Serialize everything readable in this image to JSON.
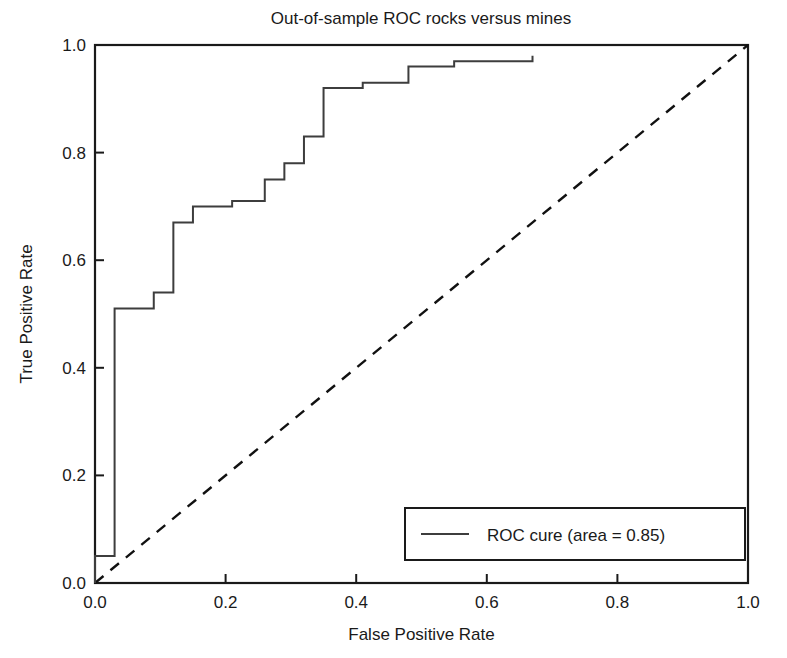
{
  "chart_data": {
    "type": "line",
    "title": "Out-of-sample ROC rocks versus mines",
    "xlabel": "False Positive Rate",
    "ylabel": "True Positive Rate",
    "xlim": [
      0.0,
      1.0
    ],
    "ylim": [
      0.0,
      1.0
    ],
    "grid": false,
    "legend_position": "lower right",
    "xticks": [
      "0.0",
      "0.2",
      "0.4",
      "0.6",
      "0.8",
      "1.0"
    ],
    "xtick_values": [
      0.0,
      0.2,
      0.4,
      0.6,
      0.8,
      1.0
    ],
    "yticks": [
      "0.0",
      "0.2",
      "0.4",
      "0.6",
      "0.8",
      "1.0"
    ],
    "ytick_values": [
      0.0,
      0.2,
      0.4,
      0.6,
      0.8,
      1.0
    ],
    "series": [
      {
        "name": "ROC cure (area = 0.85)",
        "drawstyle": "steps-post",
        "linestyle": "solid",
        "color": "#3d3d3d",
        "area_under_curve": 0.85,
        "x": [
          0.0,
          0.0,
          0.03,
          0.03,
          0.09,
          0.09,
          0.12,
          0.12,
          0.15,
          0.15,
          0.21,
          0.21,
          0.26,
          0.26,
          0.29,
          0.29,
          0.32,
          0.32,
          0.35,
          0.35,
          0.41,
          0.41,
          0.48,
          0.48,
          0.55,
          0.55,
          0.67,
          0.67
        ],
        "y": [
          0.0,
          0.05,
          0.05,
          0.51,
          0.51,
          0.54,
          0.54,
          0.67,
          0.67,
          0.7,
          0.7,
          0.71,
          0.71,
          0.75,
          0.75,
          0.78,
          0.78,
          0.83,
          0.83,
          0.92,
          0.92,
          0.93,
          0.93,
          0.96,
          0.96,
          0.97,
          0.97,
          0.98
        ]
      },
      {
        "name": "chance-diagonal",
        "drawstyle": "default",
        "linestyle": "dashed",
        "color": "#111111",
        "x": [
          0.0,
          1.0
        ],
        "y": [
          0.0,
          1.0
        ]
      }
    ],
    "legend_entries": [
      {
        "label": "ROC cure (area = 0.85)",
        "marker": "line",
        "color": "#3d3d3d"
      }
    ]
  },
  "colors": {
    "background": "#ffffff",
    "axis": "#1a1a1a",
    "roc": "#3d3d3d",
    "chance": "#111111",
    "text": "#1a1a1a"
  }
}
